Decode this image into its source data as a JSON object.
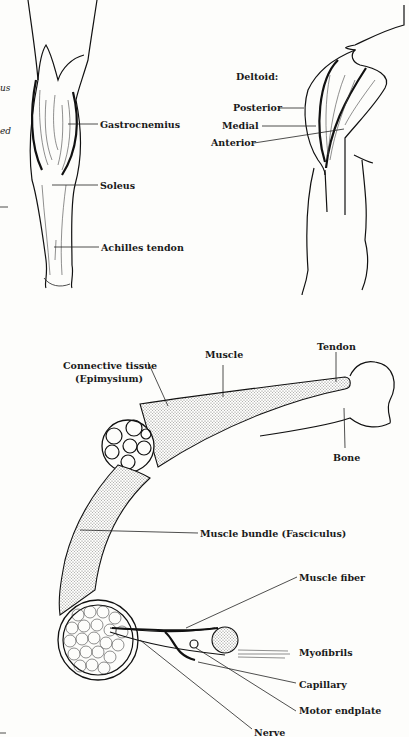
{
  "figure": {
    "left_margin_fragments": [
      "us",
      "ed"
    ],
    "calf_diagram": {
      "labels": {
        "gastrocnemius": "Gastrocnemius",
        "soleus": "Soleus",
        "achilles": "Achilles tendon"
      }
    },
    "deltoid_diagram": {
      "title": "Deltoid:",
      "labels": {
        "posterior": "Posterior",
        "medial": "Medial",
        "anterior": "Anterior"
      }
    },
    "muscle_structure_diagram": {
      "labels": {
        "connective_tissue_1": "Connective tissue",
        "connective_tissue_2": "(Epimysium)",
        "muscle": "Muscle",
        "tendon": "Tendon",
        "bone": "Bone",
        "fasciculus": "Muscle bundle (Fasciculus)",
        "muscle_fiber": "Muscle fiber",
        "myofibrils": "Myofibrils",
        "capillary": "Capillary",
        "motor_endplate": "Motor endplate",
        "nerve": "Nerve"
      }
    }
  }
}
